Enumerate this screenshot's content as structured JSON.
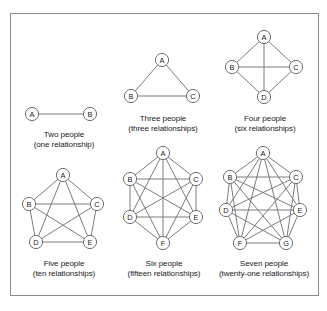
{
  "figure": {
    "border_color": "#8a8a8a",
    "background_color": "#ffffff",
    "node_stroke_color": "#6f6f6f",
    "edge_color": "#7c7c7c"
  },
  "chart_data": {
    "type": "diagram",
    "title": "",
    "subtitle": "",
    "layout": {
      "rows": 2,
      "columns": 3,
      "grid": true,
      "legend": "none"
    },
    "panels": [
      {
        "id": "k2",
        "people_count": 2,
        "relationship_count": 1,
        "caption_line1": "Two people",
        "caption_line2": "(one relationship)",
        "nodes": [
          {
            "label": "A",
            "x": 14,
            "y": 48
          },
          {
            "label": "B",
            "x": 72,
            "y": 48
          }
        ],
        "edges": [
          [
            0,
            1
          ]
        ]
      },
      {
        "id": "k3",
        "people_count": 3,
        "relationship_count": 3,
        "caption_line1": "Three people",
        "caption_line2": "(three relationships)",
        "nodes": [
          {
            "label": "A",
            "x": 45,
            "y": 16
          },
          {
            "label": "B",
            "x": 14,
            "y": 52
          },
          {
            "label": "C",
            "x": 76,
            "y": 52
          }
        ],
        "edges": [
          [
            0,
            1
          ],
          [
            0,
            2
          ],
          [
            1,
            2
          ]
        ]
      },
      {
        "id": "k4",
        "people_count": 4,
        "relationship_count": 6,
        "caption_line1": "Four people",
        "caption_line2": "(six relationships)",
        "nodes": [
          {
            "label": "A",
            "x": 45,
            "y": 13
          },
          {
            "label": "B",
            "x": 13,
            "y": 43
          },
          {
            "label": "C",
            "x": 77,
            "y": 43
          },
          {
            "label": "D",
            "x": 45,
            "y": 73
          }
        ],
        "edges": [
          [
            0,
            1
          ],
          [
            0,
            2
          ],
          [
            0,
            3
          ],
          [
            1,
            2
          ],
          [
            1,
            3
          ],
          [
            2,
            3
          ]
        ]
      },
      {
        "id": "k5",
        "people_count": 5,
        "relationship_count": 10,
        "caption_line1": "Five people",
        "caption_line2": "(ten relationships)",
        "nodes": [
          {
            "label": "A",
            "x": 45,
            "y": 13
          },
          {
            "label": "B",
            "x": 11,
            "y": 42
          },
          {
            "label": "C",
            "x": 79,
            "y": 42
          },
          {
            "label": "D",
            "x": 18,
            "y": 80
          },
          {
            "label": "E",
            "x": 72,
            "y": 80
          }
        ],
        "edges": [
          [
            0,
            1
          ],
          [
            0,
            2
          ],
          [
            0,
            3
          ],
          [
            0,
            4
          ],
          [
            1,
            2
          ],
          [
            1,
            3
          ],
          [
            1,
            4
          ],
          [
            2,
            3
          ],
          [
            2,
            4
          ],
          [
            3,
            4
          ]
        ]
      },
      {
        "id": "k6",
        "people_count": 6,
        "relationship_count": 15,
        "caption_line1": "Six people",
        "caption_line2": "(fifteen relationships)",
        "nodes": [
          {
            "label": "A",
            "x": 45,
            "y": 11
          },
          {
            "label": "B",
            "x": 12,
            "y": 37
          },
          {
            "label": "C",
            "x": 78,
            "y": 37
          },
          {
            "label": "D",
            "x": 12,
            "y": 75
          },
          {
            "label": "E",
            "x": 78,
            "y": 75
          },
          {
            "label": "F",
            "x": 45,
            "y": 101
          }
        ],
        "edges": [
          [
            0,
            1
          ],
          [
            0,
            2
          ],
          [
            0,
            3
          ],
          [
            0,
            4
          ],
          [
            0,
            5
          ],
          [
            1,
            2
          ],
          [
            1,
            3
          ],
          [
            1,
            4
          ],
          [
            1,
            5
          ],
          [
            2,
            3
          ],
          [
            2,
            4
          ],
          [
            2,
            5
          ],
          [
            3,
            4
          ],
          [
            3,
            5
          ],
          [
            4,
            5
          ]
        ]
      },
      {
        "id": "k7",
        "people_count": 7,
        "relationship_count": 21,
        "caption_line1": "Seven people",
        "caption_line2": "(twenty-one relationships)",
        "nodes": [
          {
            "label": "A",
            "x": 45,
            "y": 11
          },
          {
            "label": "B",
            "x": 12,
            "y": 35
          },
          {
            "label": "C",
            "x": 78,
            "y": 35
          },
          {
            "label": "D",
            "x": 8,
            "y": 68
          },
          {
            "label": "E",
            "x": 82,
            "y": 68
          },
          {
            "label": "F",
            "x": 22,
            "y": 101
          },
          {
            "label": "G",
            "x": 68,
            "y": 101
          }
        ],
        "edges": [
          [
            0,
            1
          ],
          [
            0,
            2
          ],
          [
            0,
            3
          ],
          [
            0,
            4
          ],
          [
            0,
            5
          ],
          [
            0,
            6
          ],
          [
            1,
            2
          ],
          [
            1,
            3
          ],
          [
            1,
            4
          ],
          [
            1,
            5
          ],
          [
            1,
            6
          ],
          [
            2,
            3
          ],
          [
            2,
            4
          ],
          [
            2,
            5
          ],
          [
            2,
            6
          ],
          [
            3,
            4
          ],
          [
            3,
            5
          ],
          [
            3,
            6
          ],
          [
            4,
            5
          ],
          [
            4,
            6
          ],
          [
            5,
            6
          ]
        ]
      }
    ]
  }
}
